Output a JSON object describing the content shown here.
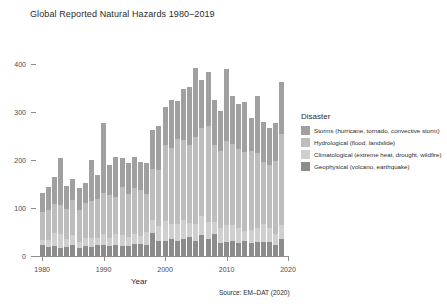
{
  "chart_data": {
    "type": "bar",
    "stacked": true,
    "title": "Global Reported Natural Hazards 1980–2019",
    "xlabel": "Year",
    "ylabel": "Number",
    "caption": "Source: EM–DAT (2020)",
    "grid": false,
    "legend_position": "right",
    "legend_title": "Disaster",
    "xlim": [
      1979,
      2020
    ],
    "ylim": [
      0,
      440
    ],
    "ytick_labels": [
      "0",
      "100",
      "200",
      "300",
      "400"
    ],
    "ytick_values": [
      0,
      100,
      200,
      300,
      400
    ],
    "xtick_labels": [
      "1980",
      "1990",
      "2000",
      "2010",
      "2020"
    ],
    "xtick_values": [
      1980,
      1990,
      2000,
      2010,
      2020
    ],
    "categories": [
      1980,
      1981,
      1982,
      1983,
      1984,
      1985,
      1986,
      1987,
      1988,
      1989,
      1990,
      1991,
      1992,
      1993,
      1994,
      1995,
      1996,
      1997,
      1998,
      1999,
      2000,
      2001,
      2002,
      2003,
      2004,
      2005,
      2006,
      2007,
      2008,
      2009,
      2010,
      2011,
      2012,
      2013,
      2014,
      2015,
      2016,
      2017,
      2018,
      2019
    ],
    "series": [
      {
        "name": "Geophysical (volcano, earthquake)",
        "color": "#8c8c8c",
        "values": [
          22,
          18,
          20,
          16,
          18,
          22,
          16,
          20,
          18,
          22,
          24,
          20,
          22,
          21,
          20,
          25,
          26,
          22,
          49,
          32,
          32,
          36,
          31,
          36,
          40,
          32,
          44,
          35,
          45,
          27,
          30,
          32,
          28,
          31,
          28,
          29,
          30,
          30,
          22,
          36
        ]
      },
      {
        "name": "Climatological (extreme heat, drought, wildfire)",
        "color": "#cfcfcf",
        "values": [
          12,
          16,
          28,
          30,
          18,
          22,
          14,
          18,
          20,
          16,
          22,
          18,
          24,
          22,
          20,
          20,
          16,
          28,
          26,
          30,
          42,
          30,
          36,
          40,
          28,
          34,
          40,
          36,
          26,
          32,
          34,
          32,
          30,
          22,
          26,
          30,
          36,
          28,
          24,
          28
        ]
      },
      {
        "name": "Hydrological (flood, landslide)",
        "color": "#bdbdbd",
        "values": [
          57,
          62,
          60,
          60,
          62,
          72,
          66,
          72,
          76,
          80,
          86,
          90,
          78,
          100,
          90,
          96,
          96,
          80,
          106,
          118,
          158,
          160,
          178,
          166,
          164,
          182,
          182,
          200,
          160,
          160,
          176,
          170,
          166,
          164,
          164,
          156,
          130,
          132,
          152,
          190
        ]
      },
      {
        "name": "Storms (hurricane, tornado, convective storm)",
        "color": "#a0a0a0",
        "values": [
          40,
          48,
          56,
          98,
          48,
          44,
          46,
          42,
          86,
          52,
          146,
          62,
          82,
          62,
          64,
          66,
          58,
          64,
          82,
          92,
          78,
          100,
          78,
          106,
          120,
          145,
          102,
          112,
          94,
          84,
          150,
          100,
          94,
          104,
          70,
          118,
          84,
          76,
          80,
          108
        ]
      }
    ]
  },
  "legend": {
    "title": "Disaster",
    "items": [
      {
        "label": "Storms (hurricane, tornado, convective storm)",
        "color": "#a0a0a0"
      },
      {
        "label": "Hydrological (flood, landslide)",
        "color": "#bdbdbd"
      },
      {
        "label": "Climatological (extreme heat, drought, wildfire)",
        "color": "#cfcfcf"
      },
      {
        "label": "Geophysical (volcano, earthquake)",
        "color": "#8c8c8c"
      }
    ]
  }
}
